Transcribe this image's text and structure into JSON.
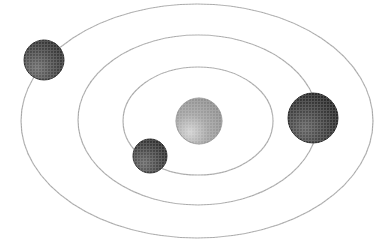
{
  "diagram": {
    "title": "Orbital system diagram",
    "description": "A central body with three concentric elliptical orbits, each carrying one orbiting body.",
    "type": "orbital-system",
    "canvas": {
      "width": 377,
      "height": 251
    },
    "background_color": "#ffffff",
    "system_center": {
      "x": 197,
      "y": 121
    }
  },
  "orbits": [
    {
      "id": "orbit-inner",
      "label": "Inner orbit",
      "index": 1,
      "cx": 198,
      "cy": 121,
      "rx": 75,
      "ry": 54,
      "stroke_color": "#a8a8a8",
      "stroke_width": 1.2
    },
    {
      "id": "orbit-middle",
      "label": "Middle orbit",
      "index": 2,
      "cx": 198,
      "cy": 120,
      "rx": 120,
      "ry": 85,
      "stroke_color": "#a8a8a8",
      "stroke_width": 1.2
    },
    {
      "id": "orbit-outer",
      "label": "Outer orbit",
      "index": 3,
      "cx": 197,
      "cy": 121,
      "rx": 176,
      "ry": 117,
      "stroke_color": "#a8a8a8",
      "stroke_width": 1.2
    }
  ],
  "bodies": [
    {
      "id": "central-body",
      "label": "Central body",
      "role": "center",
      "cx": 199,
      "cy": 121,
      "r": 23,
      "fill_color": "#a3a3a3",
      "edge_color": "#8d8d8d",
      "highlight_color": "#d2d2d2",
      "highlight_x": 190,
      "highlight_y": 132
    },
    {
      "id": "body-outer-orbit",
      "label": "Outer orbit body",
      "role": "orbiting",
      "orbit": "orbit-outer",
      "cx": 44,
      "cy": 60,
      "r": 20,
      "fill_color": "#4a4a4a",
      "edge_color": "#2a2a2a",
      "highlight_color": "#6e6e6e",
      "highlight_x": 37,
      "highlight_y": 68
    },
    {
      "id": "body-middle-orbit",
      "label": "Middle orbit body",
      "role": "orbiting",
      "orbit": "orbit-middle",
      "cx": 313,
      "cy": 118,
      "r": 25,
      "fill_color": "#3f3f3f",
      "edge_color": "#1f1f1f",
      "highlight_color": "#636363",
      "highlight_x": 305,
      "highlight_y": 128
    },
    {
      "id": "body-inner-orbit",
      "label": "Inner orbit body",
      "role": "orbiting",
      "orbit": "orbit-inner",
      "cx": 150,
      "cy": 156,
      "r": 17,
      "fill_color": "#474747",
      "edge_color": "#262626",
      "highlight_color": "#6a6a6a",
      "highlight_x": 144,
      "highlight_y": 163
    }
  ]
}
